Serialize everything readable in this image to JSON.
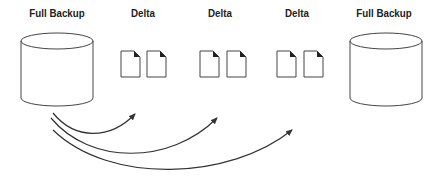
{
  "diagram": {
    "nodes": [
      {
        "id": "full-backup-1",
        "type": "cylinder",
        "label": "Full Backup"
      },
      {
        "id": "delta-1",
        "type": "document-pair",
        "label": "Delta"
      },
      {
        "id": "delta-2",
        "type": "document-pair",
        "label": "Delta"
      },
      {
        "id": "delta-3",
        "type": "document-pair",
        "label": "Delta"
      },
      {
        "id": "full-backup-2",
        "type": "cylinder",
        "label": "Full Backup"
      }
    ],
    "edges": [
      {
        "from": "full-backup-1",
        "to": "delta-1",
        "style": "curved-arrow"
      },
      {
        "from": "full-backup-1",
        "to": "delta-2",
        "style": "curved-arrow"
      },
      {
        "from": "full-backup-1",
        "to": "delta-3",
        "style": "curved-arrow"
      }
    ],
    "colors": {
      "stroke": "#333333",
      "background": "#ffffff",
      "text": "#222222"
    }
  }
}
